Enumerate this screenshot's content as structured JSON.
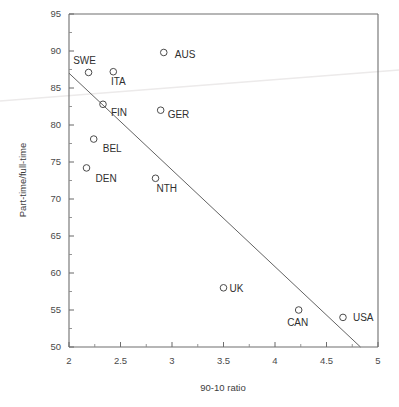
{
  "chart_data": {
    "type": "scatter",
    "title": "",
    "xlabel": "90-10 ratio",
    "ylabel": "Part-time/full-time",
    "xlim": [
      2,
      5
    ],
    "ylim": [
      50,
      95
    ],
    "grid": false,
    "legend": "none",
    "x_ticks": [
      "2",
      "2.5",
      "3",
      "3.5",
      "4",
      "4.5",
      "5"
    ],
    "x_tick_values": [
      2,
      2.5,
      3,
      3.5,
      4,
      4.5,
      5
    ],
    "x_minor_step": 0.25,
    "y_ticks": [
      "50",
      "55",
      "60",
      "65",
      "70",
      "75",
      "80",
      "85",
      "90",
      "95"
    ],
    "y_tick_values": [
      50,
      55,
      60,
      65,
      70,
      75,
      80,
      85,
      90,
      95
    ],
    "y_minor_step": 2.5,
    "marker_style": "open-circle",
    "points": [
      {
        "label": "SWE",
        "x": 2.19,
        "y": 87.1,
        "label_dx": -4,
        "label_dy": -8,
        "label_anchor": "middle"
      },
      {
        "label": "ITA",
        "x": 2.43,
        "y": 87.2,
        "label_dx": 5,
        "label_dy": 13,
        "label_anchor": "middle"
      },
      {
        "label": "FIN",
        "x": 2.33,
        "y": 82.8,
        "label_dx": 8,
        "label_dy": 12,
        "label_anchor": "start"
      },
      {
        "label": "AUS",
        "x": 2.92,
        "y": 89.8,
        "label_dx": 11,
        "label_dy": 6,
        "label_anchor": "start"
      },
      {
        "label": "GER",
        "x": 2.89,
        "y": 82.0,
        "label_dx": 7,
        "label_dy": 8,
        "label_anchor": "start"
      },
      {
        "label": "BEL",
        "x": 2.24,
        "y": 78.1,
        "label_dx": 9,
        "label_dy": 13,
        "label_anchor": "start"
      },
      {
        "label": "DEN",
        "x": 2.17,
        "y": 74.2,
        "label_dx": 9,
        "label_dy": 14,
        "label_anchor": "start"
      },
      {
        "label": "NTH",
        "x": 2.84,
        "y": 72.8,
        "label_dx": 1,
        "label_dy": 14,
        "label_anchor": "start"
      },
      {
        "label": "UK",
        "x": 3.5,
        "y": 58.0,
        "label_dx": 6,
        "label_dy": 4,
        "label_anchor": "start"
      },
      {
        "label": "CAN",
        "x": 4.23,
        "y": 55.0,
        "label_dx": -1,
        "label_dy": 16,
        "label_anchor": "middle"
      },
      {
        "label": "USA",
        "x": 4.66,
        "y": 54.0,
        "label_dx": 10,
        "label_dy": 4,
        "label_anchor": "start"
      }
    ],
    "fit_line": {
      "name": "regression-line",
      "x0": 2.0,
      "y0": 87.0,
      "x1": 4.83,
      "y1": 50.0
    },
    "annotations": [
      {
        "name": "scan-artifact",
        "description": "faint light-gray scanning streak crossing the figure"
      }
    ]
  }
}
